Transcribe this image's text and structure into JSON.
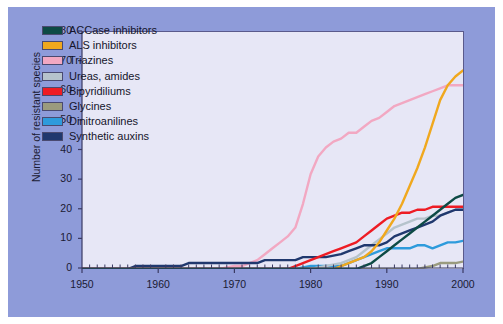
{
  "chart_data": {
    "type": "line",
    "title": "",
    "xlabel": "",
    "ylabel": "Number of resistant species",
    "xlim": [
      1950,
      2000
    ],
    "ylim": [
      0,
      80
    ],
    "xticks": [
      1950,
      1960,
      1970,
      1980,
      1990,
      2000
    ],
    "yticks": [
      0,
      10,
      20,
      30,
      40,
      50,
      60,
      70,
      80
    ],
    "xtick_labels": [
      "1950",
      "1960",
      "1970",
      "1980",
      "1990",
      "2000"
    ],
    "ytick_labels": [
      "0",
      "10",
      "20",
      "30",
      "40",
      "50",
      "60",
      "70",
      "80"
    ],
    "x_minor_tick_step": 1,
    "grid": false,
    "legend_position": "upper-left-inside",
    "background_color": "#8e9bd9",
    "plot_background_color": "#e7e7f6",
    "series": [
      {
        "name": "ACCase inhibitors",
        "color": "#0d4a45",
        "x": [
          1950,
          1982,
          1984,
          1986,
          1987,
          1988,
          1989,
          1990,
          1991,
          1992,
          1993,
          1994,
          1995,
          1996,
          1997,
          1998,
          1999,
          2000
        ],
        "values": [
          0,
          0,
          0,
          0,
          1,
          2,
          4,
          6,
          8,
          10,
          12,
          14,
          16,
          18,
          20,
          22,
          24,
          25
        ]
      },
      {
        "name": "ALS inhibitors",
        "color": "#f0a81e",
        "x": [
          1950,
          1983,
          1984,
          1985,
          1986,
          1987,
          1988,
          1989,
          1990,
          1991,
          1992,
          1993,
          1994,
          1995,
          1996,
          1997,
          1998,
          1999,
          2000
        ],
        "values": [
          0,
          0,
          1,
          2,
          3,
          4,
          6,
          9,
          13,
          17,
          22,
          28,
          34,
          41,
          49,
          57,
          62,
          65,
          67
        ]
      },
      {
        "name": "Triazines",
        "color": "#f2a8c2",
        "x": [
          1950,
          1968,
          1970,
          1971,
          1972,
          1973,
          1974,
          1975,
          1976,
          1977,
          1978,
          1979,
          1980,
          1981,
          1982,
          1983,
          1984,
          1985,
          1986,
          1987,
          1988,
          1989,
          1990,
          1991,
          1992,
          1993,
          1994,
          1995,
          1996,
          1997,
          1998,
          1999,
          2000
        ],
        "values": [
          0,
          0,
          1,
          1,
          2,
          3,
          5,
          7,
          9,
          11,
          14,
          22,
          32,
          38,
          41,
          43,
          44,
          46,
          46,
          48,
          50,
          51,
          53,
          55,
          56,
          57,
          58,
          59,
          60,
          61,
          62,
          62,
          62
        ]
      },
      {
        "name": "Ureas, amides",
        "color": "#b6c3cc",
        "x": [
          1950,
          1980,
          1982,
          1984,
          1985,
          1986,
          1987,
          1988,
          1989,
          1990,
          1991,
          1992,
          1993,
          1994,
          1995,
          1996,
          1997,
          1998,
          1999,
          2000
        ],
        "values": [
          0,
          0,
          1,
          2,
          3,
          4,
          6,
          8,
          10,
          12,
          14,
          15,
          16,
          17,
          17,
          18,
          18,
          19,
          20,
          20
        ]
      },
      {
        "name": "Bipyridiliums",
        "color": "#ee1c24",
        "x": [
          1950,
          1977,
          1978,
          1979,
          1980,
          1981,
          1982,
          1983,
          1984,
          1985,
          1986,
          1987,
          1988,
          1989,
          1990,
          1991,
          1992,
          1993,
          1994,
          1995,
          1996,
          1997,
          1998,
          1999,
          2000
        ],
        "values": [
          0,
          0,
          1,
          2,
          3,
          4,
          5,
          6,
          7,
          8,
          9,
          11,
          13,
          15,
          17,
          18,
          19,
          19,
          20,
          20,
          21,
          21,
          21,
          21,
          21
        ]
      },
      {
        "name": "Glycines",
        "color": "#9a9b7e",
        "x": [
          1950,
          1984,
          1986,
          1988,
          1990,
          1992,
          1994,
          1996,
          1997,
          1998,
          1999,
          2000
        ],
        "values": [
          0,
          0,
          0,
          0,
          0,
          0,
          0,
          1,
          2,
          2,
          2,
          2.5
        ]
      },
      {
        "name": "Dinitroanilines",
        "color": "#2e9bdc",
        "x": [
          1950,
          1978,
          1980,
          1982,
          1984,
          1985,
          1986,
          1987,
          1988,
          1989,
          1990,
          1991,
          1992,
          1993,
          1994,
          1995,
          1996,
          1997,
          1998,
          1999,
          2000
        ],
        "values": [
          0,
          0,
          1,
          1,
          1,
          2,
          3,
          4,
          5,
          6,
          7,
          7,
          7,
          7,
          8,
          8,
          7,
          8,
          9,
          9,
          9.5
        ]
      },
      {
        "name": "Synthetic auxins",
        "color": "#20386e",
        "x": [
          1950,
          1956,
          1957,
          1963,
          1964,
          1973,
          1974,
          1978,
          1979,
          1980,
          1982,
          1984,
          1985,
          1986,
          1987,
          1988,
          1989,
          1990,
          1991,
          1992,
          1993,
          1994,
          1995,
          1996,
          1997,
          1998,
          1999,
          2000
        ],
        "values": [
          0,
          0,
          1,
          1,
          2,
          2,
          3,
          3,
          4,
          4,
          4,
          5,
          6,
          7,
          8,
          8,
          8,
          9,
          11,
          12,
          13,
          14,
          15,
          16,
          18,
          19,
          20,
          20
        ]
      }
    ]
  },
  "legend": {
    "items": [
      {
        "label": "ACCase inhibitors",
        "color": "#0d4a45"
      },
      {
        "label": "ALS inhibitors",
        "color": "#f0a81e"
      },
      {
        "label": "Triazines",
        "color": "#f2a8c2"
      },
      {
        "label": "Ureas, amides",
        "color": "#b6c3cc"
      },
      {
        "label": "Bipyridiliums",
        "color": "#ee1c24"
      },
      {
        "label": "Glycines",
        "color": "#9a9b7e"
      },
      {
        "label": "Dinitroanilines",
        "color": "#2e9bdc"
      },
      {
        "label": "Synthetic auxins",
        "color": "#20386e"
      }
    ]
  }
}
